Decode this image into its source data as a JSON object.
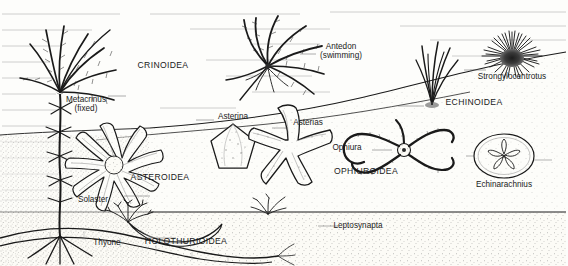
{
  "figure": {
    "medium": "pen-and-ink stipple line drawing",
    "background_color": "#fdfdfb",
    "ink_color": "#1a1a1a"
  },
  "classes": [
    {
      "id": "crinoidea",
      "name": "CRINOIDEA",
      "x": 163,
      "y": 66,
      "common": "sea lilies and feather stars"
    },
    {
      "id": "asteroidea",
      "name": "ASTEROIDEA",
      "x": 160,
      "y": 178,
      "common": "sea stars"
    },
    {
      "id": "ophiuroidea",
      "name": "OPHIUROIDEA",
      "x": 366,
      "y": 172,
      "common": "brittle stars"
    },
    {
      "id": "echinoidea",
      "name": "ECHINOIDEA",
      "x": 474,
      "y": 103,
      "common": "sea urchins and sand dollars"
    },
    {
      "id": "holothurioidea",
      "name": "HOLOTHURIOIDEA",
      "x": 186,
      "y": 242,
      "common": "sea cucumbers"
    }
  ],
  "genera": [
    {
      "id": "metacrinus",
      "name": "Metacrinus",
      "note": "(fixed)",
      "x": 86,
      "y": 101,
      "align": "center",
      "class": "crinoidea"
    },
    {
      "id": "antedon",
      "name": "Antedon",
      "note": "(swimming)",
      "x": 341,
      "y": 48,
      "align": "center",
      "class": "crinoidea"
    },
    {
      "id": "strongylocentrotus",
      "name": "Strongylocentrotus",
      "note": "",
      "x": 512,
      "y": 76,
      "align": "center",
      "class": "echinoidea"
    },
    {
      "id": "echinarachnius",
      "name": "Echinarachnius",
      "note": "",
      "x": 504,
      "y": 184,
      "align": "center",
      "class": "echinoidea"
    },
    {
      "id": "asterina",
      "name": "Asterina",
      "note": "",
      "x": 233,
      "y": 117,
      "align": "center",
      "class": "asteroidea"
    },
    {
      "id": "asterias",
      "name": "Asterias",
      "note": "",
      "x": 308,
      "y": 123,
      "align": "center",
      "class": "asteroidea"
    },
    {
      "id": "solaster",
      "name": "Solaster",
      "note": "",
      "x": 93,
      "y": 200,
      "align": "center",
      "class": "asteroidea"
    },
    {
      "id": "ophiura",
      "name": "Ophiura",
      "note": "",
      "x": 347,
      "y": 148,
      "align": "center",
      "class": "ophiuroidea"
    },
    {
      "id": "thyone",
      "name": "Thyone",
      "note": "",
      "x": 107,
      "y": 243,
      "align": "center",
      "class": "holothurioidea"
    },
    {
      "id": "leptosynapta",
      "name": "Leptosynapta",
      "note": "",
      "x": 358,
      "y": 226,
      "align": "center",
      "class": "holothurioidea"
    }
  ],
  "organisms": [
    {
      "id": "metacrinus-org",
      "label": "stalked sea lily anchored by a rooted holdfast in the sediment, plumose arms spreading upward"
    },
    {
      "id": "antedon-org",
      "label": "free-swimming feather star with radiating feathery arms"
    },
    {
      "id": "strongylocentrotus-org",
      "label": "spiny sea urchin resting on the sloping sea floor"
    },
    {
      "id": "echinarachnius-org",
      "label": "sand dollar with five-petalled petaloid pattern"
    },
    {
      "id": "asterina-org",
      "label": "pentagonal cushion star"
    },
    {
      "id": "asterias-org",
      "label": "five-armed sea star"
    },
    {
      "id": "solaster-org",
      "label": "many-armed sun star"
    },
    {
      "id": "ophiura-org",
      "label": "brittle star with long slender sinuous arms"
    },
    {
      "id": "thyone-org",
      "label": "burrowing sea cucumber with branched oral tentacles exposed at the surface"
    },
    {
      "id": "leptosynapta-org",
      "label": "worm-like burrowing sea cucumber within the sediment"
    },
    {
      "id": "seagrass-org",
      "label": "tuft of sea grass rooted on the slope"
    }
  ],
  "environment": {
    "water_column_label": "open water",
    "sediment_label": "sea floor sediment",
    "sediment_tone": "#f4f1e8"
  }
}
